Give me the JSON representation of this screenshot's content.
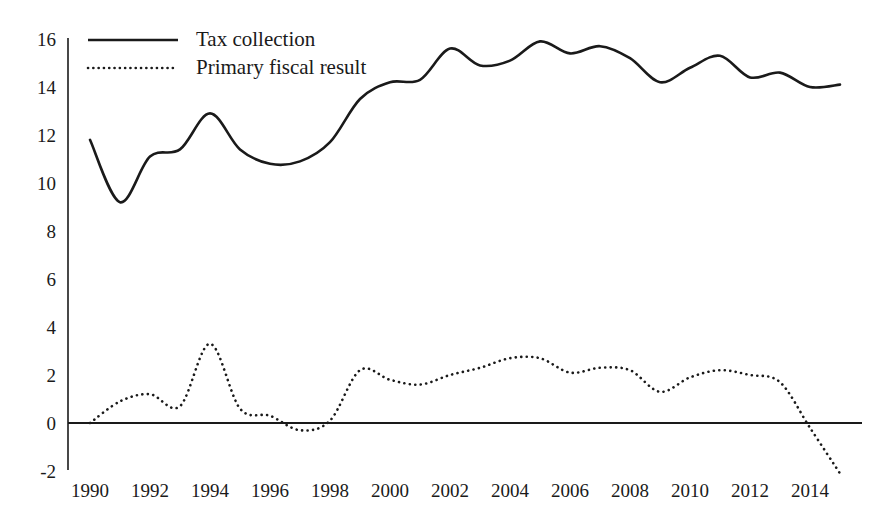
{
  "chart_data": {
    "type": "line",
    "title": "",
    "subtitle": "",
    "xlabel": "",
    "ylabel": "",
    "xlim": [
      1990,
      2015
    ],
    "ylim": [
      -2,
      16
    ],
    "yticks": [
      -2,
      0,
      2,
      4,
      6,
      8,
      10,
      12,
      14,
      16
    ],
    "ytick_labels": [
      "-2",
      "0",
      "2",
      "4",
      "6",
      "8",
      "10",
      "12",
      "14",
      "16"
    ],
    "xticks": [
      1990,
      1992,
      1994,
      1996,
      1998,
      2000,
      2002,
      2004,
      2006,
      2008,
      2010,
      2012,
      2014
    ],
    "xtick_labels": [
      "1990",
      "1992",
      "1994",
      "1996",
      "1998",
      "2000",
      "2002",
      "2004",
      "2006",
      "2008",
      "2010",
      "2012",
      "2014"
    ],
    "grid": false,
    "legend_position": "top-left",
    "zero_line": true,
    "x": [
      1990,
      1991,
      1992,
      1993,
      1994,
      1995,
      1996,
      1997,
      1998,
      1999,
      2000,
      2001,
      2002,
      2003,
      2004,
      2005,
      2006,
      2007,
      2008,
      2009,
      2010,
      2011,
      2012,
      2013,
      2014,
      2015
    ],
    "series": [
      {
        "name": "Tax collection",
        "style": "solid",
        "color": "#1a1a1a",
        "values": [
          11.8,
          9.2,
          11.1,
          11.4,
          12.9,
          11.4,
          10.8,
          10.9,
          11.7,
          13.5,
          14.2,
          14.3,
          15.6,
          14.9,
          15.1,
          15.9,
          15.4,
          15.7,
          15.2,
          14.2,
          14.8,
          15.3,
          14.4,
          14.6,
          14.0,
          14.1
        ]
      },
      {
        "name": "Primary fiscal result",
        "style": "dotted",
        "color": "#1a1a1a",
        "values": [
          0.0,
          0.9,
          1.2,
          0.7,
          3.3,
          0.6,
          0.3,
          -0.3,
          0.1,
          2.2,
          1.8,
          1.6,
          2.0,
          2.3,
          2.7,
          2.7,
          2.1,
          2.3,
          2.2,
          1.3,
          1.9,
          2.2,
          2.0,
          1.7,
          -0.2,
          -2.1
        ]
      }
    ]
  },
  "legend": {
    "entries": [
      {
        "label": "Tax collection",
        "style": "solid"
      },
      {
        "label": "Primary fiscal result",
        "style": "dotted"
      }
    ]
  }
}
